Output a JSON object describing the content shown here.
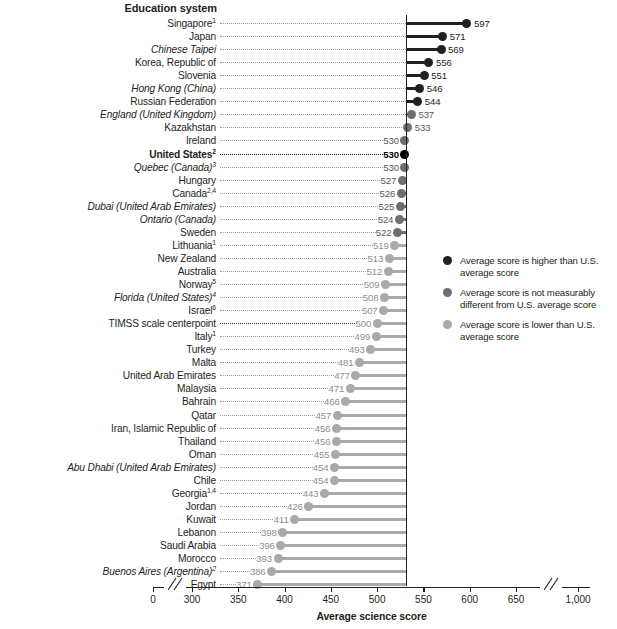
{
  "header": {
    "column_title": "Education system"
  },
  "colors": {
    "higher": "#231f20",
    "not_different": "#6d6e71",
    "lower": "#a7a9ac",
    "us_marker": "#000000",
    "axis": "#231f20",
    "leader": "#9a9a9a"
  },
  "axis": {
    "title": "Average science score",
    "ticks": [
      "0",
      "300",
      "350",
      "400",
      "450",
      "500",
      "550",
      "600",
      "650",
      "1,000"
    ],
    "tick_values": [
      0,
      300,
      350,
      400,
      450,
      500,
      550,
      600,
      650,
      1000
    ]
  },
  "legend": {
    "items": [
      {
        "label": "Average score is higher than U.S. average score",
        "category": "higher"
      },
      {
        "label": "Average score is not measurably different from U.S. average score",
        "category": "not_different"
      },
      {
        "label": "Average score is lower than U.S. average score",
        "category": "lower"
      }
    ]
  },
  "chart_data": {
    "type": "bar",
    "title": "",
    "xlabel": "Average science score",
    "ylabel": "Education system",
    "xlim": [
      0,
      1000
    ],
    "reference_value": 530,
    "reference_label": "United States",
    "grid": false,
    "legend_position": "right",
    "categories": [
      "Singapore",
      "Japan",
      "Chinese Taipei",
      "Korea, Republic of",
      "Slovenia",
      "Hong Kong (China)",
      "Russian Federation",
      "England (United Kingdom)",
      "Kazakhstan",
      "Ireland",
      "United States",
      "Quebec (Canada)",
      "Hungary",
      "Canada",
      "Dubai (United Arab Emirates)",
      "Ontario (Canada)",
      "Sweden",
      "Lithuania",
      "New Zealand",
      "Australia",
      "Norway",
      "Florida (United States)",
      "Israel",
      "TIMSS scale centerpoint",
      "Italy",
      "Turkey",
      "Malta",
      "United Arab Emirates",
      "Malaysia",
      "Bahrain",
      "Qatar",
      "Iran, Islamic Republic of",
      "Thailand",
      "Oman",
      "Abu Dhabi (United Arab Emirates)",
      "Chile",
      "Georgia",
      "Jordan",
      "Kuwait",
      "Lebanon",
      "Saudi Arabia",
      "Morocco",
      "Buenos Aires (Argentina)",
      "Egypt"
    ],
    "values": [
      597,
      571,
      569,
      556,
      551,
      546,
      544,
      537,
      533,
      530,
      530,
      530,
      527,
      526,
      525,
      524,
      522,
      519,
      513,
      512,
      509,
      508,
      507,
      500,
      499,
      493,
      481,
      477,
      471,
      466,
      457,
      456,
      456,
      455,
      454,
      454,
      443,
      426,
      411,
      398,
      396,
      393,
      386,
      371
    ]
  },
  "rows": [
    {
      "label": "Singapore",
      "sup": "1",
      "value": "597",
      "num": 597,
      "category": "higher",
      "italic": false,
      "bold": false
    },
    {
      "label": "Japan",
      "sup": "",
      "value": "571",
      "num": 571,
      "category": "higher",
      "italic": false,
      "bold": false
    },
    {
      "label": "Chinese Taipei",
      "sup": "",
      "value": "569",
      "num": 569,
      "category": "higher",
      "italic": true,
      "bold": false
    },
    {
      "label": "Korea, Republic of",
      "sup": "",
      "value": "556",
      "num": 556,
      "category": "higher",
      "italic": false,
      "bold": false
    },
    {
      "label": "Slovenia",
      "sup": "",
      "value": "551",
      "num": 551,
      "category": "higher",
      "italic": false,
      "bold": false
    },
    {
      "label": "Hong Kong (China)",
      "sup": "",
      "value": "546",
      "num": 546,
      "category": "higher",
      "italic": true,
      "bold": false
    },
    {
      "label": "Russian Federation",
      "sup": "",
      "value": "544",
      "num": 544,
      "category": "higher",
      "italic": false,
      "bold": false
    },
    {
      "label": "England (United Kingdom)",
      "sup": "",
      "value": "537",
      "num": 537,
      "category": "not_different",
      "italic": true,
      "bold": false
    },
    {
      "label": "Kazakhstan",
      "sup": "",
      "value": "533",
      "num": 533,
      "category": "not_different",
      "italic": false,
      "bold": false
    },
    {
      "label": "Ireland",
      "sup": "",
      "value": "530",
      "num": 530,
      "category": "not_different",
      "italic": false,
      "bold": false
    },
    {
      "label": "United States",
      "sup": "2",
      "value": "530",
      "num": 530,
      "category": "us",
      "italic": false,
      "bold": true
    },
    {
      "label": "Quebec (Canada)",
      "sup": "3",
      "value": "530",
      "num": 530,
      "category": "not_different",
      "italic": true,
      "bold": false
    },
    {
      "label": "Hungary",
      "sup": "",
      "value": "527",
      "num": 527,
      "category": "not_different",
      "italic": false,
      "bold": false
    },
    {
      "label": "Canada",
      "sup": "2,4",
      "value": "526",
      "num": 526,
      "category": "not_different",
      "italic": false,
      "bold": false
    },
    {
      "label": "Dubai (United Arab Emirates)",
      "sup": "",
      "value": "525",
      "num": 525,
      "category": "not_different",
      "italic": true,
      "bold": false
    },
    {
      "label": "Ontario (Canada)",
      "sup": "",
      "value": "524",
      "num": 524,
      "category": "not_different",
      "italic": true,
      "bold": false
    },
    {
      "label": "Sweden",
      "sup": "",
      "value": "522",
      "num": 522,
      "category": "not_different",
      "italic": false,
      "bold": false
    },
    {
      "label": "Lithuania",
      "sup": "1",
      "value": "519",
      "num": 519,
      "category": "lower",
      "italic": false,
      "bold": false
    },
    {
      "label": "New Zealand",
      "sup": "",
      "value": "513",
      "num": 513,
      "category": "lower",
      "italic": false,
      "bold": false
    },
    {
      "label": "Australia",
      "sup": "",
      "value": "512",
      "num": 512,
      "category": "lower",
      "italic": false,
      "bold": false
    },
    {
      "label": "Norway",
      "sup": "5",
      "value": "509",
      "num": 509,
      "category": "lower",
      "italic": false,
      "bold": false
    },
    {
      "label": "Florida (United States)",
      "sup": "4",
      "value": "508",
      "num": 508,
      "category": "lower",
      "italic": true,
      "bold": false
    },
    {
      "label": "Israel",
      "sup": "6",
      "value": "507",
      "num": 507,
      "category": "lower",
      "italic": false,
      "bold": false
    },
    {
      "label": "TIMSS scale centerpoint",
      "sup": "",
      "value": "500",
      "num": 500,
      "category": "centerpoint",
      "italic": false,
      "bold": false
    },
    {
      "label": "Italy",
      "sup": "1",
      "value": "499",
      "num": 499,
      "category": "lower",
      "italic": false,
      "bold": false
    },
    {
      "label": "Turkey",
      "sup": "",
      "value": "493",
      "num": 493,
      "category": "lower",
      "italic": false,
      "bold": false
    },
    {
      "label": "Malta",
      "sup": "",
      "value": "481",
      "num": 481,
      "category": "lower",
      "italic": false,
      "bold": false
    },
    {
      "label": "United Arab Emirates",
      "sup": "",
      "value": "477",
      "num": 477,
      "category": "lower",
      "italic": false,
      "bold": false
    },
    {
      "label": "Malaysia",
      "sup": "",
      "value": "471",
      "num": 471,
      "category": "lower",
      "italic": false,
      "bold": false
    },
    {
      "label": "Bahrain",
      "sup": "",
      "value": "466",
      "num": 466,
      "category": "lower",
      "italic": false,
      "bold": false
    },
    {
      "label": "Qatar",
      "sup": "",
      "value": "457",
      "num": 457,
      "category": "lower",
      "italic": false,
      "bold": false
    },
    {
      "label": "Iran, Islamic Republic of",
      "sup": "",
      "value": "456",
      "num": 456,
      "category": "lower",
      "italic": false,
      "bold": false
    },
    {
      "label": "Thailand",
      "sup": "",
      "value": "456",
      "num": 456,
      "category": "lower",
      "italic": false,
      "bold": false
    },
    {
      "label": "Oman",
      "sup": "",
      "value": "455",
      "num": 455,
      "category": "lower",
      "italic": false,
      "bold": false
    },
    {
      "label": "Abu Dhabi (United Arab Emirates)",
      "sup": "",
      "value": "454",
      "num": 454,
      "category": "lower",
      "italic": true,
      "bold": false
    },
    {
      "label": "Chile",
      "sup": "",
      "value": "454",
      "num": 454,
      "category": "lower",
      "italic": false,
      "bold": false
    },
    {
      "label": "Georgia",
      "sup": "1,4",
      "value": "443",
      "num": 443,
      "category": "lower",
      "italic": false,
      "bold": false
    },
    {
      "label": "Jordan",
      "sup": "",
      "value": "426",
      "num": 426,
      "category": "lower",
      "italic": false,
      "bold": false
    },
    {
      "label": "Kuwait",
      "sup": "",
      "value": "411",
      "num": 411,
      "category": "lower",
      "italic": false,
      "bold": false
    },
    {
      "label": "Lebanon",
      "sup": "",
      "value": "398",
      "num": 398,
      "category": "lower",
      "italic": false,
      "bold": false
    },
    {
      "label": "Saudi Arabia",
      "sup": "",
      "value": "396",
      "num": 396,
      "category": "lower",
      "italic": false,
      "bold": false
    },
    {
      "label": "Morocco",
      "sup": "",
      "value": "393",
      "num": 393,
      "category": "lower",
      "italic": false,
      "bold": false
    },
    {
      "label": "Buenos Aires (Argentina)",
      "sup": "2",
      "value": "386",
      "num": 386,
      "category": "lower",
      "italic": true,
      "bold": false
    },
    {
      "label": "Egypt",
      "sup": "",
      "value": "371",
      "num": 371,
      "category": "lower",
      "italic": false,
      "bold": false
    }
  ]
}
